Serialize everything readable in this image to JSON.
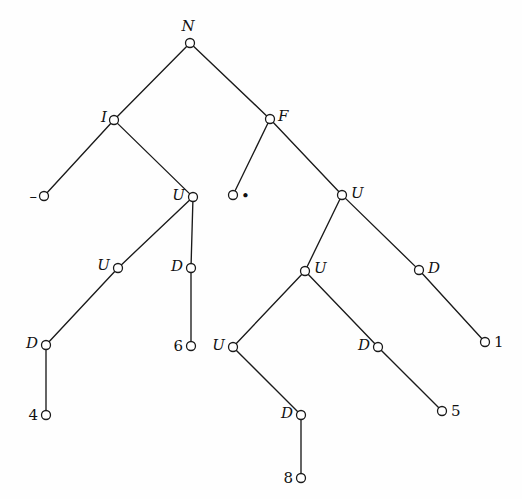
{
  "figure": {
    "background_color": "#fefefe",
    "line_color": "#1a1a1a",
    "node_fill": "#ffffff",
    "width": 522,
    "height": 499
  },
  "chart_data": {
    "type": "diagram",
    "subtype": "binary-tree",
    "title": "",
    "node_radius": 4.5,
    "nodes": [
      {
        "id": "n0",
        "label": "N",
        "kind": "internal",
        "x": 190,
        "y": 43,
        "label_pos": "above",
        "label_dx": -2,
        "label_dy": -9
      },
      {
        "id": "n1",
        "label": "I",
        "kind": "internal",
        "x": 114,
        "y": 120,
        "label_pos": "left",
        "label_dx": -7,
        "label_dy": -3
      },
      {
        "id": "n2",
        "label": "F",
        "kind": "internal",
        "x": 270,
        "y": 119,
        "label_pos": "right",
        "label_dx": 8,
        "label_dy": -3
      },
      {
        "id": "n3",
        "label": "–",
        "kind": "leaf",
        "x": 44,
        "y": 196,
        "label_pos": "left",
        "label_dx": -7,
        "label_dy": 0
      },
      {
        "id": "n4",
        "label": "U",
        "kind": "internal",
        "x": 193,
        "y": 197,
        "label_pos": "left",
        "label_dx": -8,
        "label_dy": -2
      },
      {
        "id": "n5",
        "label": "•",
        "kind": "leaf",
        "x": 233,
        "y": 195,
        "label_pos": "right",
        "label_dx": 8,
        "label_dy": 1
      },
      {
        "id": "n6",
        "label": "U",
        "kind": "internal",
        "x": 342,
        "y": 195,
        "label_pos": "right",
        "label_dx": 9,
        "label_dy": -2
      },
      {
        "id": "n7",
        "label": "U",
        "kind": "internal",
        "x": 118,
        "y": 268,
        "label_pos": "left",
        "label_dx": -8,
        "label_dy": -3
      },
      {
        "id": "n8",
        "label": "D",
        "kind": "internal",
        "x": 191,
        "y": 268,
        "label_pos": "left",
        "label_dx": -8,
        "label_dy": -2
      },
      {
        "id": "n9",
        "label": "U",
        "kind": "internal",
        "x": 305,
        "y": 271,
        "label_pos": "right",
        "label_dx": 9,
        "label_dy": -3
      },
      {
        "id": "n10",
        "label": "D",
        "kind": "internal",
        "x": 419,
        "y": 270,
        "label_pos": "right",
        "label_dx": 9,
        "label_dy": -2
      },
      {
        "id": "n11",
        "label": "D",
        "kind": "internal",
        "x": 46,
        "y": 345,
        "label_pos": "left",
        "label_dx": -8,
        "label_dy": -2
      },
      {
        "id": "n12",
        "label": "6",
        "kind": "leaf",
        "x": 191,
        "y": 346,
        "label_pos": "left",
        "label_dx": -8,
        "label_dy": 0
      },
      {
        "id": "n13",
        "label": "U",
        "kind": "internal",
        "x": 233,
        "y": 347,
        "label_pos": "left",
        "label_dx": -8,
        "label_dy": -2
      },
      {
        "id": "n14",
        "label": "D",
        "kind": "internal",
        "x": 378,
        "y": 347,
        "label_pos": "left",
        "label_dx": -8,
        "label_dy": -2
      },
      {
        "id": "n15",
        "label": "1",
        "kind": "leaf",
        "x": 485,
        "y": 342,
        "label_pos": "right",
        "label_dx": 9,
        "label_dy": 0
      },
      {
        "id": "n16",
        "label": "4",
        "kind": "leaf",
        "x": 46,
        "y": 415,
        "label_pos": "left",
        "label_dx": -8,
        "label_dy": 0
      },
      {
        "id": "n17",
        "label": "D",
        "kind": "internal",
        "x": 301,
        "y": 415,
        "label_pos": "left",
        "label_dx": -8,
        "label_dy": -2
      },
      {
        "id": "n18",
        "label": "5",
        "kind": "leaf",
        "x": 442,
        "y": 411,
        "label_pos": "right",
        "label_dx": 9,
        "label_dy": 0
      },
      {
        "id": "n19",
        "label": "8",
        "kind": "leaf",
        "x": 301,
        "y": 478,
        "label_pos": "left",
        "label_dx": -8,
        "label_dy": 0
      }
    ],
    "edges": [
      {
        "from": "n0",
        "to": "n1"
      },
      {
        "from": "n0",
        "to": "n2"
      },
      {
        "from": "n1",
        "to": "n3"
      },
      {
        "from": "n1",
        "to": "n4"
      },
      {
        "from": "n2",
        "to": "n5"
      },
      {
        "from": "n2",
        "to": "n6"
      },
      {
        "from": "n4",
        "to": "n7"
      },
      {
        "from": "n4",
        "to": "n8"
      },
      {
        "from": "n6",
        "to": "n9"
      },
      {
        "from": "n6",
        "to": "n10"
      },
      {
        "from": "n7",
        "to": "n11"
      },
      {
        "from": "n8",
        "to": "n12"
      },
      {
        "from": "n9",
        "to": "n13"
      },
      {
        "from": "n9",
        "to": "n14"
      },
      {
        "from": "n10",
        "to": "n15"
      },
      {
        "from": "n11",
        "to": "n16"
      },
      {
        "from": "n13",
        "to": "n17"
      },
      {
        "from": "n14",
        "to": "n18"
      },
      {
        "from": "n17",
        "to": "n19"
      }
    ]
  }
}
